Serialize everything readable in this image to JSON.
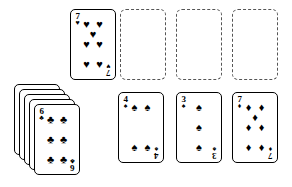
{
  "board": {
    "background_color": "#ffffff",
    "ink_color": "#000000",
    "slot_border_color": "#555555",
    "width": 292,
    "height": 187
  },
  "suits": {
    "hearts": "♥",
    "spades": "♠",
    "clubs": "♣",
    "diamonds": "♦"
  },
  "tableau": {
    "waste_card": {
      "rank": "7",
      "suit_name": "hearts",
      "suit_symbol": "♥",
      "pip_count": 7,
      "face": "up",
      "x": 70,
      "y": 9,
      "w": 46,
      "h": 71
    },
    "foundation_slots": [
      {
        "label": "",
        "x": 120,
        "y": 9,
        "w": 46,
        "h": 71
      },
      {
        "label": "",
        "x": 176,
        "y": 9,
        "w": 46,
        "h": 71
      },
      {
        "label": "",
        "x": 232,
        "y": 9,
        "w": 46,
        "h": 71
      }
    ],
    "stock_pile": {
      "face_down_count": 4,
      "offset_x": 5,
      "offset_y": 5,
      "x": 14,
      "y": 84,
      "w": 46,
      "h": 71,
      "top_card": {
        "rank": "6",
        "suit_name": "clubs",
        "suit_symbol": "♣",
        "pip_count": 6,
        "face": "up"
      }
    },
    "bottom_row": [
      {
        "rank": "4",
        "suit_name": "spades",
        "suit_symbol": "♠",
        "pip_count": 4,
        "face": "up",
        "x": 118,
        "y": 92,
        "w": 46,
        "h": 71
      },
      {
        "rank": "3",
        "suit_name": "spades",
        "suit_symbol": "♠",
        "pip_count": 3,
        "face": "up",
        "x": 176,
        "y": 92,
        "w": 46,
        "h": 71
      },
      {
        "rank": "7",
        "suit_name": "diamonds",
        "suit_symbol": "♦",
        "pip_count": 7,
        "face": "up",
        "x": 232,
        "y": 92,
        "w": 46,
        "h": 71
      }
    ]
  }
}
